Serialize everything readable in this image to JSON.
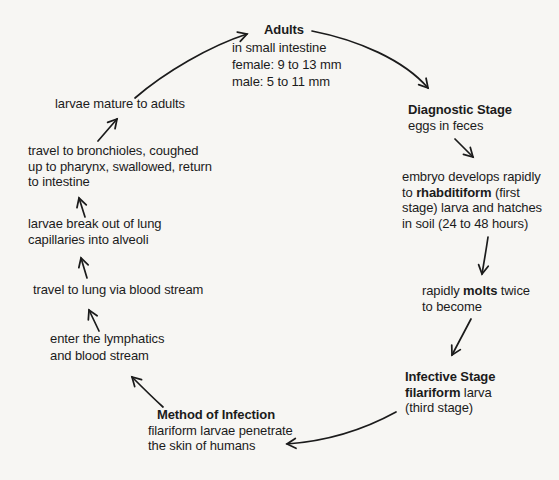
{
  "theme": {
    "ink_color": "#1b1b1b",
    "paper_color": "#f7f6f3"
  },
  "diagram": {
    "nodes": {
      "adults": {
        "lines": [
          [
            {
              "t": "Adults",
              "b": 1
            }
          ],
          [
            {
              "t": "in small intestine"
            }
          ],
          [
            {
              "t": "female: 9 to 13 mm"
            }
          ],
          [
            {
              "t": "male: 5 to 11 mm"
            }
          ]
        ]
      },
      "diagnostic": {
        "lines": [
          [
            {
              "t": "Diagnostic Stage",
              "b": 1
            }
          ],
          [
            {
              "t": "eggs in feces"
            }
          ]
        ]
      },
      "embryo": {
        "lines": [
          [
            {
              "t": "embryo develops rapidly"
            }
          ],
          [
            {
              "t": "to "
            },
            {
              "t": "rhabditiform",
              "b": 1
            },
            {
              "t": " (first"
            }
          ],
          [
            {
              "t": "stage) larva and hatches"
            }
          ],
          [
            {
              "t": "in soil (24 to 48 hours)"
            }
          ]
        ]
      },
      "molts": {
        "lines": [
          [
            {
              "t": "rapidly "
            },
            {
              "t": "molts",
              "b": 1
            },
            {
              "t": " twice"
            }
          ],
          [
            {
              "t": "to become"
            }
          ]
        ]
      },
      "infective": {
        "lines": [
          [
            {
              "t": "Infective Stage",
              "b": 1
            }
          ],
          [
            {
              "t": "filariform",
              "b": 1
            },
            {
              "t": " larva"
            }
          ],
          [
            {
              "t": "(third stage)"
            }
          ]
        ]
      },
      "method": {
        "lines": [
          [
            {
              "t": "Method of Infection",
              "b": 1
            }
          ],
          [
            {
              "t": "filariform larvae penetrate"
            }
          ],
          [
            {
              "t": "the skin of humans"
            }
          ]
        ]
      },
      "lymphatics": {
        "lines": [
          [
            {
              "t": "enter the lymphatics"
            }
          ],
          [
            {
              "t": "and blood stream"
            }
          ]
        ]
      },
      "lung": {
        "lines": [
          [
            {
              "t": "travel to lung via blood stream"
            }
          ]
        ]
      },
      "alveoli": {
        "lines": [
          [
            {
              "t": "larvae break out of lung"
            }
          ],
          [
            {
              "t": "capillaries into alveoli"
            }
          ]
        ]
      },
      "bronchioles": {
        "lines": [
          [
            {
              "t": "travel to bronchioles, coughed"
            }
          ],
          [
            {
              "t": "up to pharynx, swallowed, return"
            }
          ],
          [
            {
              "t": "to intestine"
            }
          ]
        ]
      },
      "mature": {
        "lines": [
          [
            {
              "t": "larvae mature to adults"
            }
          ]
        ]
      }
    }
  }
}
